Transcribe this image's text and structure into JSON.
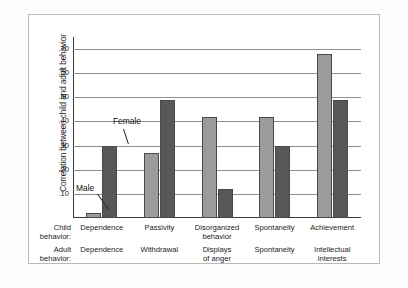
{
  "chart": {
    "type": "bar",
    "ylabel": "Correlation between child and adult behavior",
    "row_labels": {
      "child": "Child\nbehavior:",
      "child_line1": "Child",
      "child_line2": "behavior:",
      "adult_line1": "Adult",
      "adult_line2": "behavior:"
    },
    "legend": {
      "male": "Male",
      "female": "Female"
    },
    "colors": {
      "male": "#9b9b9b",
      "female": "#585858",
      "gridline": "#8f8f8f",
      "axis": "#3a3a3a",
      "frame": "#b9b9b9",
      "background": "#ffffff"
    },
    "yticks": [
      ".70",
      ".60",
      ".50",
      ".40",
      ".30",
      ".20",
      ".10"
    ],
    "ytick_values": [
      0.7,
      0.6,
      0.5,
      0.4,
      0.3,
      0.2,
      0.1
    ],
    "ylim": [
      0,
      0.75
    ],
    "grid": true,
    "legend_position": "inline-annotation"
  },
  "chart_data": {
    "type": "bar",
    "title": "",
    "xlabel": "",
    "ylabel": "Correlation between child and adult behavior",
    "ylim": [
      0,
      0.75
    ],
    "yticks": [
      0.1,
      0.2,
      0.3,
      0.4,
      0.5,
      0.6,
      0.7
    ],
    "ytick_labels": [
      ".10",
      ".20",
      ".30",
      ".40",
      ".50",
      ".60",
      ".70"
    ],
    "grid": true,
    "legend": [
      "Male",
      "Female"
    ],
    "legend_position": "annotated on first group bars",
    "categories": [
      "Dependence",
      "Passivity",
      "Disorganized behavior",
      "Spontaneity",
      "Achievement"
    ],
    "child_behavior": [
      "Dependence",
      "Passivity",
      "Disorganized behavior",
      "Spontaneity",
      "Achievement"
    ],
    "adult_behavior": [
      "Dependence",
      "Withdrawal",
      "Displays of anger",
      "Spontaneity",
      "Intellectual interests"
    ],
    "series": [
      {
        "name": "Male",
        "values": [
          0.02,
          0.27,
          0.42,
          0.42,
          0.68
        ]
      },
      {
        "name": "Female",
        "values": [
          0.3,
          0.49,
          0.12,
          0.3,
          0.49
        ]
      }
    ]
  },
  "xaxis": {
    "groups": [
      {
        "child_line1": "Dependence",
        "child_line2": "",
        "adult_line1": "Dependence",
        "adult_line2": ""
      },
      {
        "child_line1": "Passivity",
        "child_line2": "",
        "adult_line1": "Withdrawal",
        "adult_line2": ""
      },
      {
        "child_line1": "Disorganized",
        "child_line2": "behavior",
        "adult_line1": "Displays",
        "adult_line2": "of anger"
      },
      {
        "child_line1": "Spontaneity",
        "child_line2": "",
        "adult_line1": "Spontaneity",
        "adult_line2": ""
      },
      {
        "child_line1": "Achievement",
        "child_line2": "",
        "adult_line1": "Intellectual",
        "adult_line2": "interests"
      }
    ]
  }
}
